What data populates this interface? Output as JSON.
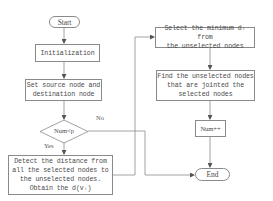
{
  "diagram": {
    "type": "flowchart",
    "nodes": {
      "start": {
        "label": "Start",
        "shape": "terminal"
      },
      "init": {
        "label": "Initialization",
        "shape": "process"
      },
      "set_nodes": {
        "label": "Set source node and\ndestination node",
        "shape": "process"
      },
      "decision": {
        "label": "Num<p",
        "shape": "decision"
      },
      "detect": {
        "label": "Detect the distance from\nall the selected nodes to\nthe unselected nodes.\nObtain the d(vᵢ)",
        "shape": "process"
      },
      "select_min": {
        "label": "Select the minimum dᵢ from\nthe unselected nodes",
        "shape": "process"
      },
      "find": {
        "label": "Find the unselected nodes\nthat are jointed the\nselected nodes",
        "shape": "process"
      },
      "increment": {
        "label": "Num++",
        "shape": "process"
      },
      "end": {
        "label": "End",
        "shape": "terminal"
      }
    },
    "edge_labels": {
      "no": "No",
      "yes": "Yes"
    },
    "edges": [
      {
        "from": "start",
        "to": "init"
      },
      {
        "from": "init",
        "to": "set_nodes"
      },
      {
        "from": "set_nodes",
        "to": "decision"
      },
      {
        "from": "decision",
        "to": "detect",
        "label": "Yes"
      },
      {
        "from": "decision",
        "to": "end",
        "label": "No"
      },
      {
        "from": "detect",
        "to": "select_min"
      },
      {
        "from": "select_min",
        "to": "find"
      },
      {
        "from": "find",
        "to": "increment"
      },
      {
        "from": "increment",
        "to": "end"
      }
    ],
    "colors": {
      "stroke": "#8a8a8a",
      "text": "#4a4a4a",
      "background": "#ffffff"
    }
  }
}
